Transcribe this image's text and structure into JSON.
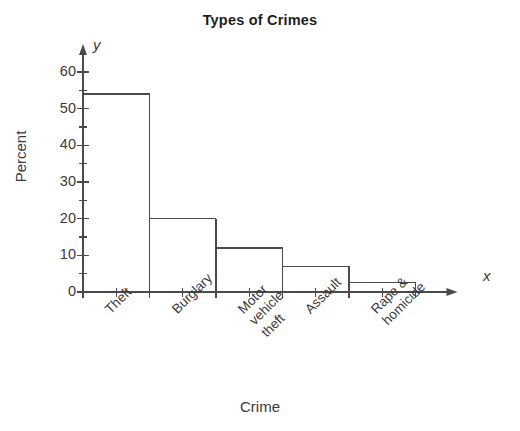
{
  "chart_data": {
    "type": "bar",
    "title": "Types of Crimes",
    "xlabel": "Crime",
    "ylabel": "Percent",
    "axis_letter_x": "x",
    "axis_letter_y": "y",
    "categories": [
      "Theft",
      "Burglary",
      "Motor\nvehicle\ntheft",
      "Assault",
      "Rape &\nhomicide"
    ],
    "values": [
      54,
      20,
      12,
      7,
      2.5
    ],
    "ylim": [
      0,
      60
    ],
    "yticks": [
      0,
      10,
      20,
      30,
      40,
      50,
      60
    ],
    "ytick_labels": [
      "0",
      "10",
      "20",
      "30",
      "40",
      "50",
      "60"
    ],
    "yminor_step": 5,
    "grid": false,
    "legend": "none",
    "bar_fill": "none",
    "bar_edge_color": "#4a4a4a",
    "axis_color": "#4a4a4a",
    "background": "#ffffff"
  }
}
